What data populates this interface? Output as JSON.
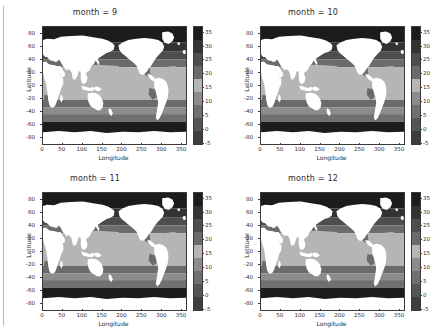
{
  "figure": {
    "rows": 2,
    "cols": 2,
    "background": "#ffffff",
    "axis_color": "#3a3a3a",
    "text_color": "#2b2b2b"
  },
  "chart_data": {
    "type": "heatmap",
    "title": "",
    "subtitle": "",
    "colormap": "grayscale",
    "xlabel": "Longitude",
    "ylabel": "Latitude",
    "xlim": [
      0,
      360
    ],
    "ylim": [
      -90,
      90
    ],
    "xticks": [
      0,
      50,
      100,
      150,
      200,
      250,
      300,
      350
    ],
    "xticklabels": [
      "0",
      "50",
      "100",
      "150",
      "200",
      "250",
      "300",
      "350"
    ],
    "yticks": [
      80,
      60,
      40,
      20,
      0,
      -20,
      -40,
      -60,
      -80
    ],
    "yticklabels": [
      "80",
      "60",
      "40",
      "20",
      "0",
      "-20",
      "-40",
      "-60",
      "-80"
    ],
    "grid": false,
    "legend_position": "right",
    "colorbar": {
      "label": "",
      "vmin": -5,
      "vmax": 37,
      "ticks": [
        35,
        30,
        25,
        20,
        15,
        10,
        5,
        0,
        -5
      ],
      "ticklabels": [
        "35",
        "30",
        "25",
        "20",
        "15",
        "10",
        "5",
        "0",
        "-5"
      ],
      "levels": [
        -5,
        0,
        5,
        10,
        15,
        20,
        25,
        30,
        35
      ],
      "level_colors": [
        "#1c1c1c",
        "#333333",
        "#4d4d4d",
        "#6b6b6b",
        "#b5b5b5",
        "#8c8c8c",
        "#707070",
        "#555555",
        "#3d3d3d"
      ]
    },
    "panels": [
      {
        "title": "month = 9",
        "facet_variable": "month",
        "facet_value": 9,
        "variable": "sea surface temperature",
        "row": 0,
        "col": 0
      },
      {
        "title": "month = 10",
        "facet_variable": "month",
        "facet_value": 10,
        "variable": "sea surface temperature",
        "row": 0,
        "col": 1
      },
      {
        "title": "month = 11",
        "facet_variable": "month",
        "facet_value": 11,
        "variable": "sea surface temperature",
        "row": 1,
        "col": 0
      },
      {
        "title": "month = 12",
        "facet_variable": "month",
        "facet_value": 12,
        "variable": "sea surface temperature",
        "row": 1,
        "col": 1
      }
    ]
  }
}
